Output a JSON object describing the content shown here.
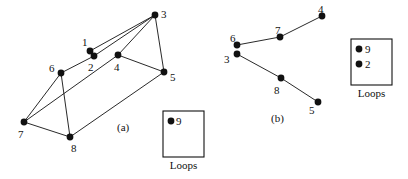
{
  "figure": {
    "background": "#ffffff",
    "ink_color": "#111111",
    "panels": [
      {
        "id": "panel-a",
        "caption": "(a)",
        "caption_pos": {
          "x": 117,
          "y": 122
        },
        "nodes": [
          {
            "id": "1",
            "label": "1",
            "x": 90,
            "y": 51,
            "r": 3.4,
            "label_pos": {
              "x": 82,
              "y": 37
            }
          },
          {
            "id": "2",
            "label": "2",
            "x": 94,
            "y": 56,
            "r": 3.4,
            "label_pos": {
              "x": 88,
              "y": 62
            }
          },
          {
            "id": "3",
            "label": "3",
            "x": 155,
            "y": 15,
            "r": 3.4,
            "label_pos": {
              "x": 161,
              "y": 9
            }
          },
          {
            "id": "4",
            "label": "4",
            "x": 118,
            "y": 55,
            "r": 3.4,
            "label_pos": {
              "x": 114,
              "y": 62
            }
          },
          {
            "id": "5",
            "label": "5",
            "x": 164,
            "y": 72,
            "r": 3.4,
            "label_pos": {
              "x": 170,
              "y": 72
            }
          },
          {
            "id": "6",
            "label": "6",
            "x": 61,
            "y": 73,
            "r": 3.4,
            "label_pos": {
              "x": 49,
              "y": 63
            }
          },
          {
            "id": "7",
            "label": "7",
            "x": 24,
            "y": 122,
            "r": 3.4,
            "label_pos": {
              "x": 18,
              "y": 129
            }
          },
          {
            "id": "8",
            "label": "8",
            "x": 70,
            "y": 137,
            "r": 3.4,
            "label_pos": {
              "x": 71,
              "y": 143
            }
          }
        ],
        "edges": [
          {
            "from": "1",
            "to": "3"
          },
          {
            "from": "2",
            "to": "3"
          },
          {
            "from": "3",
            "to": "4"
          },
          {
            "from": "3",
            "to": "5"
          },
          {
            "from": "4",
            "to": "5"
          },
          {
            "from": "2",
            "to": "6"
          },
          {
            "from": "6",
            "to": "7"
          },
          {
            "from": "6",
            "to": "8"
          },
          {
            "from": "7",
            "to": "8"
          },
          {
            "from": "7",
            "to": "4"
          },
          {
            "from": "8",
            "to": "5"
          }
        ],
        "loops_box": {
          "caption": "Loops",
          "x": 163,
          "y": 111,
          "width": 41,
          "height": 46,
          "caption_pos": {
            "x": 163,
            "y": 160
          },
          "entries": [
            {
              "label": "9",
              "dot_x": 171,
              "dot_y": 121,
              "r": 3.4,
              "label_pos": {
                "x": 176,
                "y": 116
              }
            }
          ]
        }
      },
      {
        "id": "panel-b",
        "caption": "(b)",
        "caption_pos": {
          "x": 271,
          "y": 113
        },
        "nodes": [
          {
            "id": "3",
            "label": "3",
            "x": 237,
            "y": 54,
            "r": 3.4,
            "label_pos": {
              "x": 224,
              "y": 54
            }
          },
          {
            "id": "4",
            "label": "4",
            "x": 322,
            "y": 16,
            "r": 3.4,
            "label_pos": {
              "x": 318,
              "y": 4
            }
          },
          {
            "id": "5",
            "label": "5",
            "x": 318,
            "y": 102,
            "r": 3.4,
            "label_pos": {
              "x": 309,
              "y": 105
            }
          },
          {
            "id": "6",
            "label": "6",
            "x": 237,
            "y": 45,
            "r": 3.4,
            "label_pos": {
              "x": 230,
              "y": 33
            }
          },
          {
            "id": "7",
            "label": "7",
            "x": 280,
            "y": 37,
            "r": 3.4,
            "label_pos": {
              "x": 275,
              "y": 25
            }
          },
          {
            "id": "8",
            "label": "8",
            "x": 281,
            "y": 78,
            "r": 3.4,
            "label_pos": {
              "x": 274,
              "y": 85
            }
          }
        ],
        "edges": [
          {
            "from": "6",
            "to": "7"
          },
          {
            "from": "7",
            "to": "4"
          },
          {
            "from": "3",
            "to": "8"
          },
          {
            "from": "8",
            "to": "5"
          }
        ],
        "loops_box": {
          "caption": "Loops",
          "x": 351,
          "y": 39,
          "width": 41,
          "height": 46,
          "caption_pos": {
            "x": 351,
            "y": 88
          },
          "entries": [
            {
              "label": "9",
              "dot_x": 359,
              "dot_y": 49,
              "r": 3.4,
              "label_pos": {
                "x": 365,
                "y": 44
              }
            },
            {
              "label": "2",
              "dot_x": 359,
              "dot_y": 64,
              "r": 3.4,
              "label_pos": {
                "x": 365,
                "y": 59
              }
            }
          ]
        }
      }
    ]
  }
}
